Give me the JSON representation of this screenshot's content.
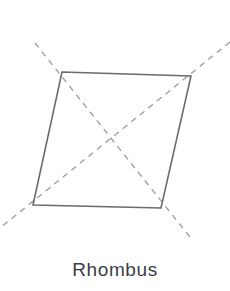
{
  "figure": {
    "caption": "Rhombus",
    "canvas": {
      "width": 230,
      "height": 291,
      "background": "#ffffff"
    },
    "outline": {
      "name": "rhombus-outline",
      "color": "#6b6b70",
      "stroke_width": 1.6,
      "style": "solid",
      "points": "62,72 191,76 161,208 33,205",
      "vertices": [
        {
          "label": "top-left",
          "x": 62,
          "y": 72
        },
        {
          "label": "top-right",
          "x": 191,
          "y": 76
        },
        {
          "label": "bottom-right",
          "x": 161,
          "y": 208
        },
        {
          "label": "bottom-left",
          "x": 33,
          "y": 205
        }
      ]
    },
    "diagonals": {
      "color": "#9a9aa0",
      "stroke_width": 1.3,
      "style": "dashed",
      "dash_pattern": "6 5",
      "lines": [
        {
          "name": "diagonal-top-left-to-bottom-right",
          "x1": 35,
          "y1": 43,
          "x2": 190,
          "y2": 237
        },
        {
          "name": "diagonal-top-right-to-bottom-left",
          "x1": 230,
          "y1": 42,
          "x2": 0,
          "y2": 228
        }
      ],
      "intersection": {
        "x": 110,
        "y": 143
      }
    }
  }
}
